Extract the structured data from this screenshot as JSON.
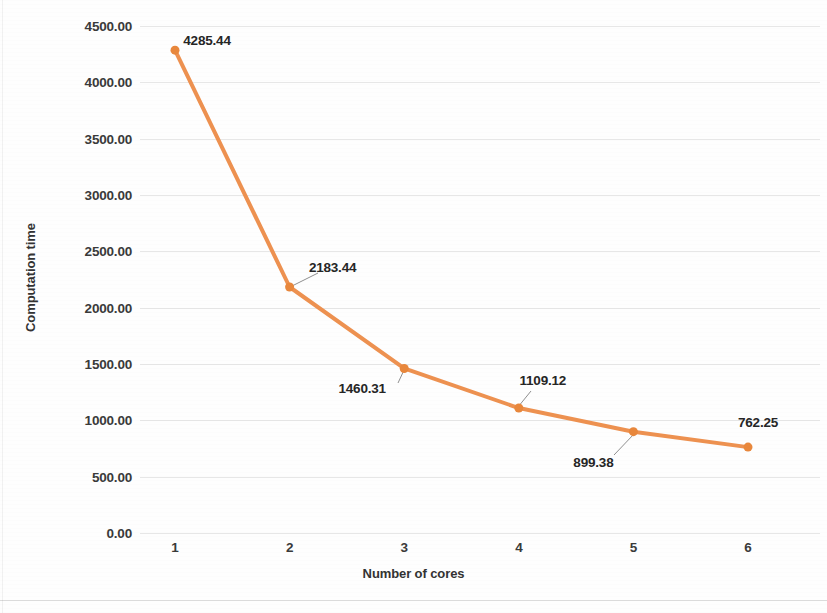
{
  "chart_data": {
    "type": "line",
    "title": "",
    "xlabel": "Number of cores",
    "ylabel": "Computation time",
    "categories": [
      "1",
      "2",
      "3",
      "4",
      "5",
      "6"
    ],
    "values": [
      4285.44,
      2183.44,
      1460.31,
      1109.12,
      899.38,
      762.25
    ],
    "point_labels": [
      "4285.44",
      "2183.44",
      "1460.31",
      "1109.12",
      "899.38",
      "762.25"
    ],
    "ylim": [
      0,
      4500
    ],
    "ytick_labels": [
      "4500.00",
      "4000.00",
      "3500.00",
      "3000.00",
      "2500.00",
      "2000.00",
      "1500.00",
      "1000.00",
      "500.00",
      "0.00"
    ],
    "ytick_values": [
      4500,
      4000,
      3500,
      3000,
      2500,
      2000,
      1500,
      1000,
      500,
      0
    ],
    "grid": true,
    "legend": "none",
    "series_color": "#ED9150",
    "marker_color": "#E8873C",
    "marker_shape": "circle",
    "leader_line_color": "#8f8f8f",
    "series": [
      {
        "name": "Computation time",
        "values": [
          4285.44,
          2183.44,
          1460.31,
          1109.12,
          899.38,
          762.25
        ]
      }
    ],
    "label_positions": [
      {
        "label": "4285.44",
        "place": "above-right"
      },
      {
        "label": "2183.44",
        "place": "above-right"
      },
      {
        "label": "1460.31",
        "place": "below-left"
      },
      {
        "label": "1109.12",
        "place": "above-right"
      },
      {
        "label": "899.38",
        "place": "below-left"
      },
      {
        "label": "762.25",
        "place": "above-right"
      }
    ]
  }
}
